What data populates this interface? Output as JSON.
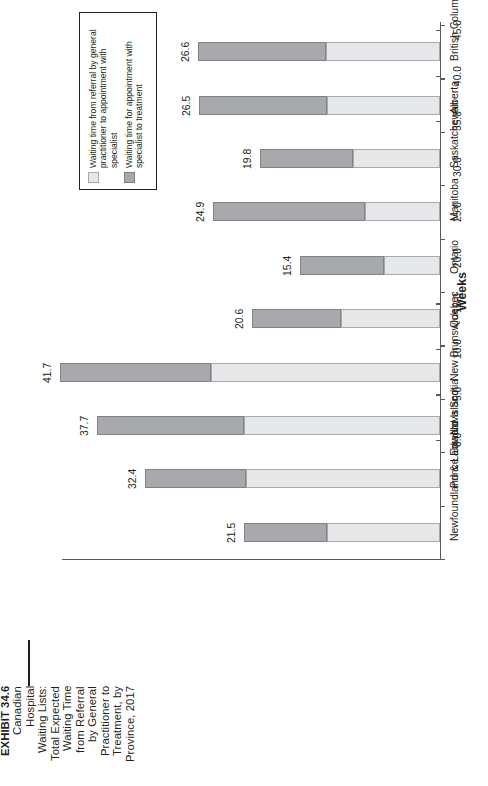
{
  "exhibit": {
    "number": "EXHIBIT 34.6",
    "title_lines": [
      "EXHIBIT 34.6",
      "Canadian",
      "Hospital",
      "Waiting Lists:",
      "Total Expected",
      "Waiting Time",
      "from Referral",
      "by General",
      "Practitioner to",
      "Treatment, by",
      "Province, 2017"
    ]
  },
  "legend": {
    "entries": [
      {
        "label": "Waiting time from referral by general practitioner to appointment with specialist",
        "color": "#e6e7e8"
      },
      {
        "label": "Waiting time for appointment with specialist to treatment",
        "color": "#a7a9ac"
      }
    ]
  },
  "chart_data": {
    "type": "bar",
    "orientation": "horizontal-stacked",
    "xlabel": "Weeks",
    "ylabel": "",
    "xlim": [
      0.0,
      45.0
    ],
    "grid": false,
    "legend_position": "top-left",
    "tick_labels": [
      "0.0",
      "5.0",
      "10.0",
      "15.0",
      "20.0",
      "25.0",
      "30.0",
      "35.0",
      "40.0",
      "45.0"
    ],
    "tick_values": [
      0,
      5,
      10,
      15,
      20,
      25,
      30,
      35,
      40,
      45
    ],
    "categories": [
      "British Columbia",
      "Alberta",
      "Saskatchewan",
      "Manitoba",
      "Ontario",
      "Quebec",
      "New Brunswick",
      "Nova Scotia",
      "Prince Edward Island",
      "Newfoundland & Labrador"
    ],
    "series": [
      {
        "name": "Waiting time from referral by general practitioner to appointment with specialist",
        "color": "#e6e7e8",
        "values": [
          12.5,
          12.4,
          9.6,
          8.2,
          6.2,
          10.9,
          25.1,
          21.5,
          21.3,
          12.4
        ]
      },
      {
        "name": "Waiting time for appointment with specialist to treatment",
        "color": "#a7a9ac",
        "values": [
          14.1,
          14.1,
          10.2,
          16.7,
          9.2,
          9.7,
          16.6,
          16.2,
          11.1,
          9.1
        ]
      }
    ],
    "totals": [
      26.6,
      26.5,
      19.8,
      24.9,
      15.4,
      20.6,
      41.7,
      37.7,
      32.4,
      21.5
    ],
    "total_labels": [
      "26.6",
      "26.5",
      "19.8",
      "24.9",
      "15.4",
      "20.6",
      "41.7",
      "37.7",
      "32.4",
      "21.5"
    ]
  }
}
